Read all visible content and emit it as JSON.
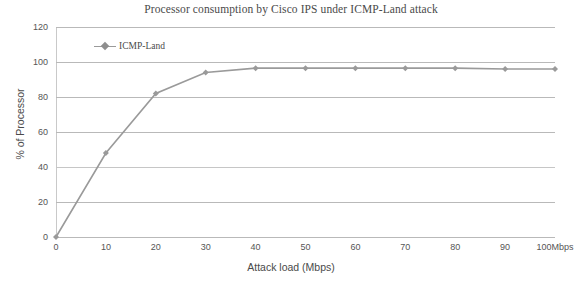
{
  "chart_data": {
    "type": "line",
    "title": "Processor consumption by Cisco IPS under ICMP-Land attack",
    "xlabel": "Attack load (Mbps)",
    "ylabel": "% of Processor",
    "xlim": [
      0,
      100
    ],
    "ylim": [
      0,
      120
    ],
    "grid": true,
    "legend_position": "top-left-inside",
    "x": [
      0,
      10,
      20,
      30,
      40,
      50,
      60,
      70,
      80,
      90,
      100
    ],
    "xtick_labels": [
      "0",
      "10",
      "20",
      "30",
      "40",
      "50",
      "60",
      "70",
      "80",
      "90",
      "100Mbps"
    ],
    "ytick_labels": [
      "0",
      "20",
      "40",
      "60",
      "80",
      "100",
      "120"
    ],
    "yticks": [
      0,
      20,
      40,
      60,
      80,
      100,
      120
    ],
    "series": [
      {
        "name": "ICMP-Land",
        "color": "#9a9a9a",
        "marker": "diamond",
        "values": [
          0,
          48,
          82,
          94,
          96.5,
          96.5,
          96.5,
          96.5,
          96.5,
          96,
          96
        ]
      }
    ]
  },
  "legend": {
    "entries": [
      {
        "label": "ICMP-Land"
      }
    ]
  },
  "colors": {
    "series": "#9a9a9a",
    "grid": "#b9b9b9",
    "axis": "#c9c9c9",
    "text": "#4a4a4a",
    "background": "#ffffff"
  }
}
